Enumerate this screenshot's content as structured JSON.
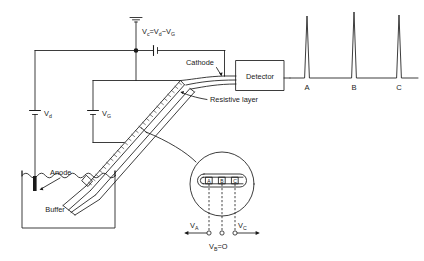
{
  "figure": {
    "domain_kind": "diagram"
  },
  "labels": {
    "v_c_equation": "Vc=Vd−VG",
    "v_c_main": "V",
    "v_c_sub": "c",
    "v_c_rest": "=V",
    "v_d_sub": "d",
    "v_minus": "−V",
    "v_g_sub": "G",
    "vd_label": "V",
    "vd_sub": "d",
    "vg_label": "V",
    "vg_sub": "G",
    "anode": "Anode",
    "buffer": "Buffer",
    "cathode": "Cathode",
    "detector": "Detector",
    "resistive_layer": "Resistive layer",
    "va_label": "V",
    "va_sub": "A",
    "vc_label": "V",
    "vc_sub": "C",
    "vb_label": "V",
    "vb_sub": "B",
    "vb_value": "=O",
    "band_a": "A",
    "band_b": "B",
    "band_c": "C"
  },
  "electropherogram": {
    "peaks": [
      {
        "id": "peak-a",
        "label": "A",
        "x": 307,
        "height": 62
      },
      {
        "id": "peak-b",
        "label": "B",
        "x": 354,
        "height": 66
      },
      {
        "id": "peak-c",
        "label": "C",
        "x": 399,
        "height": 63
      }
    ],
    "baseline_y": 78,
    "baseline_x_start": 288,
    "baseline_x_end": 418
  },
  "inset": {
    "bands": [
      {
        "label": "A",
        "x": 209
      },
      {
        "label": "B",
        "x": 222
      },
      {
        "label": "C",
        "x": 235
      }
    ],
    "circle": {
      "cx": 222,
      "cy": 184,
      "r": 32
    }
  },
  "colors": {
    "ink": "#1a1a1a",
    "background": "#ffffff"
  }
}
